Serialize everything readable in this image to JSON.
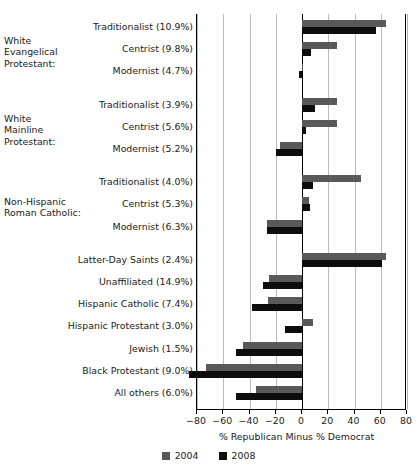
{
  "chart_data": {
    "type": "bar",
    "orientation": "horizontal",
    "title": "",
    "xlabel": "% Republican Minus % Democrat",
    "ylabel": "",
    "xlim": [
      -80,
      80
    ],
    "xticks": [
      -80,
      -60,
      -40,
      -20,
      0,
      20,
      40,
      60,
      80
    ],
    "xtick_labels": [
      "−80",
      "−60",
      "−40",
      "−20",
      "0",
      "20",
      "40",
      "60",
      "80"
    ],
    "grid": true,
    "legend_position": "bottom",
    "series": [
      {
        "name": "2004",
        "color": "#595959"
      },
      {
        "name": "2008",
        "color": "#0d0d0d"
      }
    ],
    "groups": [
      {
        "heading": "White\nEvangelical\nProtestant:",
        "heading_lines": [
          "White",
          "Evangelical",
          "Protestant:"
        ],
        "categories": [
          {
            "label": "Traditionalist (10.9%)",
            "v2004": 64,
            "v2008": 56
          },
          {
            "label": "Centrist (9.8%)",
            "v2004": 27,
            "v2008": 7
          },
          {
            "label": "Modernist (4.7%)",
            "v2004": 1,
            "v2008": -2
          }
        ]
      },
      {
        "heading": "White\nMainline\nProtestant:",
        "heading_lines": [
          "White",
          "Mainline",
          "Protestant:"
        ],
        "categories": [
          {
            "label": "Traditionalist (3.9%)",
            "v2004": 27,
            "v2008": 10
          },
          {
            "label": "Centrist (5.6%)",
            "v2004": 27,
            "v2008": 3
          },
          {
            "label": "Modernist (5.2%)",
            "v2004": -17,
            "v2008": -20
          }
        ]
      },
      {
        "heading": "Non-Hispanic\nRoman Catholic:",
        "heading_lines": [
          "Non-Hispanic",
          "Roman Catholic:"
        ],
        "categories": [
          {
            "label": "Traditionalist (4.0%)",
            "v2004": 45,
            "v2008": 8
          },
          {
            "label": "Centrist (5.3%)",
            "v2004": 5,
            "v2008": 6
          },
          {
            "label": "Modernist (6.3%)",
            "v2004": -27,
            "v2008": -27
          }
        ]
      },
      {
        "heading": "",
        "heading_lines": [],
        "categories": [
          {
            "label": "Latter-Day Saints (2.4%)",
            "v2004": 64,
            "v2008": 61
          },
          {
            "label": "Unaffiliated (14.9%)",
            "v2004": -25,
            "v2008": -30
          },
          {
            "label": "Hispanic Catholic (7.4%)",
            "v2004": -26,
            "v2008": -38
          },
          {
            "label": "Hispanic Protestant (3.0%)",
            "v2004": 8,
            "v2008": -13
          },
          {
            "label": "Jewish (1.5%)",
            "v2004": -45,
            "v2008": -50
          },
          {
            "label": "Black Protestant (9.0%)",
            "v2004": -73,
            "v2008": -86
          },
          {
            "label": "All others (6.0%)",
            "v2004": -35,
            "v2008": -50
          }
        ]
      }
    ]
  },
  "legend": {
    "items": [
      {
        "label": "2004"
      },
      {
        "label": "2008"
      }
    ]
  },
  "axis": {
    "title": "% Republican Minus % Democrat"
  }
}
